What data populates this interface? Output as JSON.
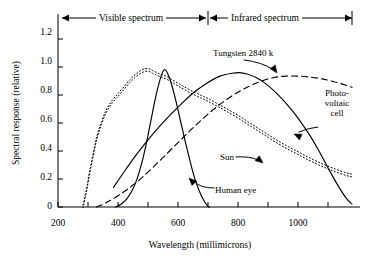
{
  "chart_data": {
    "type": "line",
    "title": "",
    "xlabel": "Wavelength (millimicrons)",
    "ylabel": "Spectral response (relative)",
    "xlim": [
      200,
      1180
    ],
    "ylim": [
      0,
      1.3
    ],
    "xticks": [
      200,
      400,
      600,
      800,
      1000
    ],
    "xticklabels": [
      "200",
      "400",
      "600",
      "800",
      "1000"
    ],
    "xminorticks": [
      300,
      500,
      700,
      900,
      1100
    ],
    "yticks": [
      0,
      0.2,
      0.4,
      0.6,
      0.8,
      1.0,
      1.2
    ],
    "yticklabels": [
      "0",
      "0.2",
      "0.4",
      "0.6",
      "0.8",
      "1.0",
      "1.2"
    ],
    "grid": false,
    "legend_position": "inline-annotations",
    "bands": [
      {
        "name": "visible",
        "label": "Visible spectrum",
        "from": 200,
        "to": 700
      },
      {
        "name": "infrared",
        "label": "Infrared spectrum",
        "from": 700,
        "to": 1180
      }
    ],
    "series": [
      {
        "name": "Sun",
        "style": "dotted-double",
        "label": "Sun",
        "points": [
          [
            283,
            0.0
          ],
          [
            295,
            0.12
          ],
          [
            305,
            0.24
          ],
          [
            318,
            0.38
          ],
          [
            330,
            0.5
          ],
          [
            345,
            0.6
          ],
          [
            360,
            0.68
          ],
          [
            380,
            0.75
          ],
          [
            400,
            0.8
          ],
          [
            420,
            0.85
          ],
          [
            440,
            0.9
          ],
          [
            460,
            0.94
          ],
          [
            480,
            0.97
          ],
          [
            500,
            0.98
          ],
          [
            515,
            0.965
          ],
          [
            530,
            0.95
          ],
          [
            545,
            0.935
          ],
          [
            560,
            0.925
          ],
          [
            580,
            0.9
          ],
          [
            600,
            0.875
          ],
          [
            620,
            0.85
          ],
          [
            650,
            0.815
          ],
          [
            680,
            0.785
          ],
          [
            700,
            0.765
          ],
          [
            730,
            0.73
          ],
          [
            760,
            0.695
          ],
          [
            800,
            0.645
          ],
          [
            840,
            0.59
          ],
          [
            880,
            0.535
          ],
          [
            920,
            0.48
          ],
          [
            960,
            0.43
          ],
          [
            1000,
            0.385
          ],
          [
            1040,
            0.34
          ],
          [
            1080,
            0.3
          ],
          [
            1120,
            0.265
          ],
          [
            1160,
            0.235
          ],
          [
            1180,
            0.225
          ]
        ]
      },
      {
        "name": "Human eye",
        "style": "solid",
        "label": "Human eye",
        "points": [
          [
            392,
            0.0
          ],
          [
            410,
            0.02
          ],
          [
            430,
            0.06
          ],
          [
            450,
            0.13
          ],
          [
            465,
            0.21
          ],
          [
            480,
            0.32
          ],
          [
            495,
            0.46
          ],
          [
            510,
            0.62
          ],
          [
            525,
            0.78
          ],
          [
            540,
            0.91
          ],
          [
            552,
            0.975
          ],
          [
            560,
            0.975
          ],
          [
            570,
            0.93
          ],
          [
            582,
            0.85
          ],
          [
            595,
            0.74
          ],
          [
            610,
            0.6
          ],
          [
            625,
            0.46
          ],
          [
            640,
            0.33
          ],
          [
            655,
            0.21
          ],
          [
            670,
            0.12
          ],
          [
            685,
            0.05
          ],
          [
            700,
            0.005
          ],
          [
            705,
            0.0
          ]
        ]
      },
      {
        "name": "Photovoltaic cell",
        "style": "solid",
        "label": "Photo-voltaic cell",
        "label_lines": [
          "Photo-",
          "voltaic",
          "cell"
        ],
        "points": [
          [
            385,
            0.14
          ],
          [
            420,
            0.25
          ],
          [
            460,
            0.37
          ],
          [
            500,
            0.48
          ],
          [
            540,
            0.58
          ],
          [
            580,
            0.67
          ],
          [
            620,
            0.755
          ],
          [
            660,
            0.83
          ],
          [
            700,
            0.89
          ],
          [
            740,
            0.935
          ],
          [
            780,
            0.955
          ],
          [
            805,
            0.96
          ],
          [
            830,
            0.95
          ],
          [
            860,
            0.925
          ],
          [
            890,
            0.885
          ],
          [
            920,
            0.83
          ],
          [
            950,
            0.765
          ],
          [
            980,
            0.69
          ],
          [
            1010,
            0.605
          ],
          [
            1040,
            0.51
          ],
          [
            1070,
            0.4
          ],
          [
            1100,
            0.28
          ],
          [
            1130,
            0.165
          ],
          [
            1160,
            0.065
          ],
          [
            1180,
            0.02
          ]
        ]
      },
      {
        "name": "Tungsten 2840 k",
        "style": "dashed",
        "label": "Tungsten 2840 k",
        "points": [
          [
            328,
            0.0
          ],
          [
            360,
            0.03
          ],
          [
            400,
            0.08
          ],
          [
            440,
            0.14
          ],
          [
            480,
            0.21
          ],
          [
            520,
            0.29
          ],
          [
            560,
            0.375
          ],
          [
            600,
            0.46
          ],
          [
            640,
            0.545
          ],
          [
            680,
            0.625
          ],
          [
            720,
            0.7
          ],
          [
            760,
            0.765
          ],
          [
            800,
            0.82
          ],
          [
            840,
            0.865
          ],
          [
            880,
            0.9
          ],
          [
            920,
            0.925
          ],
          [
            960,
            0.935
          ],
          [
            1000,
            0.935
          ],
          [
            1040,
            0.928
          ],
          [
            1080,
            0.915
          ],
          [
            1120,
            0.895
          ],
          [
            1160,
            0.87
          ],
          [
            1180,
            0.855
          ]
        ]
      }
    ],
    "annotations": [
      {
        "name": "tungsten-annotation",
        "text": "Tungsten 2840 k",
        "target_series": "Tungsten 2840 k"
      },
      {
        "name": "photovoltaic-annotation",
        "text": "Photo-voltaic cell",
        "target_series": "Photovoltaic cell"
      },
      {
        "name": "sun-annotation",
        "text": "Sun",
        "target_series": "Sun"
      },
      {
        "name": "human-eye-annotation",
        "text": "Human eye",
        "target_series": "Human eye"
      }
    ],
    "colors": {
      "ink": "#000000",
      "background": "#ffffff"
    }
  }
}
